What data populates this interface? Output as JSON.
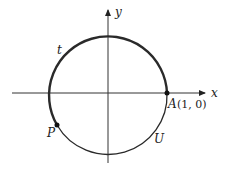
{
  "diagram": {
    "type": "unit-circle",
    "axes": {
      "x_label": "x",
      "y_label": "y"
    },
    "points": {
      "A": {
        "name": "A",
        "coords": "(1, 0)"
      },
      "P": {
        "name": "P"
      }
    },
    "arc_labels": {
      "t": "t",
      "U": "U"
    },
    "colors": {
      "stroke": "#2a2a2a",
      "background": "#ffffff"
    }
  }
}
